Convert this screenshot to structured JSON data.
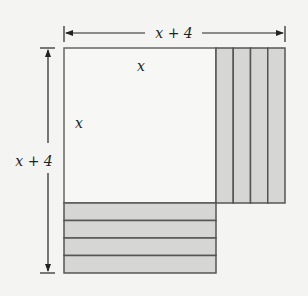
{
  "diagram": {
    "top_dimension_label": "x + 4",
    "left_dimension_label": "x + 4",
    "inner_top_label": "x",
    "inner_left_label": "x",
    "colors": {
      "background": "#f4f4f3",
      "strip_fill": "#d6d6d4",
      "line": "#555555"
    },
    "strips_right_count": 4,
    "strips_bottom_count": 4
  }
}
